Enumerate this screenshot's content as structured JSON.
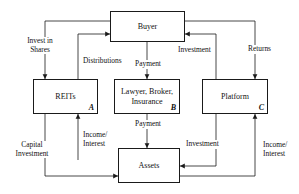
{
  "diagram": {
    "nodes": [
      {
        "id": "buyer",
        "label": "Buyer",
        "tag": ""
      },
      {
        "id": "reits",
        "label": "REITs",
        "tag": "A"
      },
      {
        "id": "lawyer",
        "label": "Lawyer, Broker,\nInsurance",
        "tag": "B"
      },
      {
        "id": "platform",
        "label": "Platform",
        "tag": "C"
      },
      {
        "id": "assets",
        "label": "Assets",
        "tag": ""
      }
    ],
    "edge_labels": [
      {
        "id": "invest-in-shares",
        "text": "Invest in\nShares"
      },
      {
        "id": "distributions",
        "text": "Distributions"
      },
      {
        "id": "payment-top",
        "text": "Payment"
      },
      {
        "id": "investment-top",
        "text": "Investment"
      },
      {
        "id": "returns",
        "text": "Returns"
      },
      {
        "id": "capital-investment",
        "text": "Capital\nInvestment"
      },
      {
        "id": "income-interest-left",
        "text": "Income/\nInterest"
      },
      {
        "id": "payment-bottom",
        "text": "Payment"
      },
      {
        "id": "investment-bottom",
        "text": "Investment"
      },
      {
        "id": "income-interest-right",
        "text": "Income/\nInterest"
      }
    ],
    "colors": {
      "stroke": "#1a1a1a",
      "background": "#ffffff",
      "text": "#111111"
    }
  }
}
